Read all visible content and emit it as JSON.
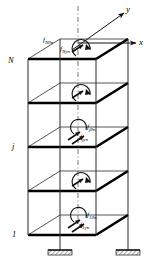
{
  "diagram": {
    "type": "structural-isometric",
    "floors_total": 5,
    "colors": {
      "line": "#1a1a1a",
      "slab_edge": "#000000",
      "slab_fill": "#ffffff",
      "centerline": "#555555",
      "background": "#ffffff"
    },
    "axes": [
      {
        "name": "x-axis",
        "label": "x",
        "direction": "right"
      },
      {
        "name": "y-axis",
        "label": "y",
        "direction": "up-right"
      },
      {
        "name": "vertical-centerline",
        "label": "",
        "direction": "up",
        "style": "dash-dot"
      }
    ],
    "floor_labels": [
      {
        "name": "floor-label-N",
        "label": "N",
        "level": "top"
      },
      {
        "name": "floor-label-j",
        "label": "j",
        "level": "middle"
      },
      {
        "name": "floor-label-1",
        "label": "1",
        "level": "bottom"
      }
    ],
    "force_groups": [
      {
        "name": "forces-floor-N",
        "moment": {
          "base": "f",
          "sub": "Nθn"
        },
        "force": {
          "base": "f",
          "sub": "Nyn"
        }
      },
      {
        "name": "forces-floor-j",
        "moment": {
          "base": "f",
          "sub": "jθn"
        },
        "force": {
          "base": "f",
          "sub": "jyn"
        }
      },
      {
        "name": "forces-floor-1",
        "moment": {
          "base": "f",
          "sub": "1θn"
        },
        "force": {
          "base": "f",
          "sub": "1yn"
        }
      }
    ],
    "unlabeled_force_markers": [
      {
        "name": "force-marker-level-4"
      },
      {
        "name": "force-marker-level-2"
      }
    ],
    "supports": [
      {
        "name": "fixed-support-left",
        "type": "fixed-hatched"
      },
      {
        "name": "fixed-support-right",
        "type": "fixed-hatched"
      }
    ]
  }
}
